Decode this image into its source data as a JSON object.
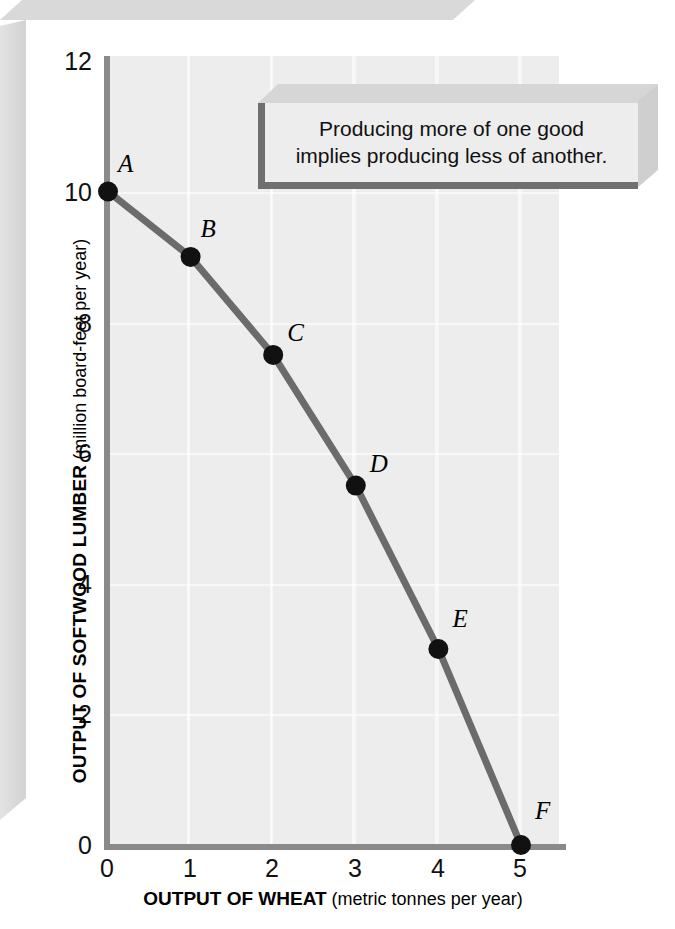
{
  "chart_data": {
    "type": "line",
    "title": "",
    "subtitle": "",
    "xlabel_bold": "OUTPUT OF WHEAT",
    "xlabel_regular": " (metric tonnes per year)",
    "ylabel_bold": "OUTPUT OF SOFTWOOD LUMBER",
    "ylabel_regular": " (million board-feet per year)",
    "xlim": [
      0,
      5.5
    ],
    "ylim": [
      0,
      12
    ],
    "xticks": [
      "0",
      "1",
      "2",
      "3",
      "4",
      "5"
    ],
    "xtick_values": [
      0,
      1,
      2,
      3,
      4,
      5
    ],
    "yticks": [
      "0",
      "2",
      "4",
      "6",
      "8",
      "10",
      "12"
    ],
    "ytick_values": [
      0,
      2,
      4,
      6,
      8,
      10,
      12
    ],
    "grid": true,
    "legend": "none",
    "series": [
      {
        "name": "Production possibilities frontier",
        "x": [
          0,
          1,
          2,
          3,
          4,
          5
        ],
        "values": [
          10,
          9,
          7.5,
          5.5,
          3,
          0
        ],
        "point_labels": [
          "A",
          "B",
          "C",
          "D",
          "E",
          "F"
        ],
        "line_color": "#6b6b6b",
        "marker_color": "#111111"
      }
    ],
    "annotations": [
      {
        "name": "callout",
        "line1": "Producing more of one good",
        "line2": "implies producing less of another."
      }
    ]
  },
  "colors": {
    "panel_background": "#ededed",
    "axis": "#8a8a8a",
    "curve": "#6b6b6b",
    "marker": "#111111",
    "bevel": "#d8d8d8",
    "callout_border": "#6f6f6f",
    "text": "#111111"
  }
}
